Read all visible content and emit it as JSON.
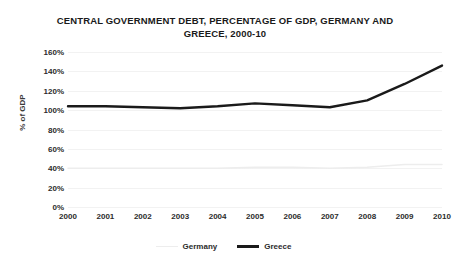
{
  "chart_data": {
    "type": "line",
    "title": "CENTRAL GOVERNMENT DEBT, PERCENTAGE OF GDP, GERMANY AND GREECE, 2000-10",
    "title_line1": "CENTRAL GOVERNMENT DEBT, PERCENTAGE OF GDP, GERMANY AND",
    "title_line2": "GREECE, 2000-10",
    "xlabel": "",
    "ylabel": "% of GDP",
    "categories": [
      "2000",
      "2001",
      "2002",
      "2003",
      "2004",
      "2005",
      "2006",
      "2007",
      "2008",
      "2009",
      "2010"
    ],
    "ytick_labels": [
      "160%",
      "140%",
      "120%",
      "100%",
      "80%",
      "60%",
      "40%",
      "20%",
      "0%"
    ],
    "ytick_values": [
      160,
      140,
      120,
      100,
      80,
      60,
      40,
      20,
      0
    ],
    "ylim": [
      0,
      160
    ],
    "grid": true,
    "legend_position": "bottom",
    "series": [
      {
        "name": "Germany",
        "color": "#ededed",
        "line_width": 1.5,
        "values": [
          40,
          40,
          40,
          40,
          40,
          41,
          41,
          40,
          41,
          44,
          44
        ]
      },
      {
        "name": "Greece",
        "color": "#1a1a1a",
        "line_width": 2.4,
        "values": [
          104,
          104,
          103,
          102,
          104,
          107,
          105,
          103,
          110,
          127,
          146
        ]
      }
    ]
  }
}
